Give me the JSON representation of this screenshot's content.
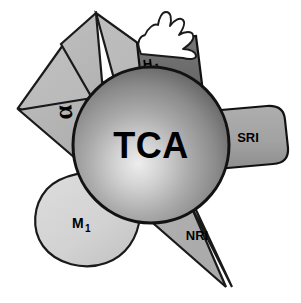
{
  "figure": {
    "title": "",
    "center": {
      "label": "TCA",
      "shape": "sphere",
      "fill_light": "#d9d9d9",
      "fill_mid": "#9a9a9a",
      "fill_dark": "#5f5f5f",
      "stroke": "#000000"
    },
    "receptors": [
      {
        "id": "alpha",
        "label": "α",
        "label_kind": "greek",
        "shape": "star-point-upper-left",
        "fill": "#b5b5b5",
        "stroke": "#000000",
        "label_x": 68,
        "label_y": 116,
        "label_size": 26,
        "label_rotation": -95
      },
      {
        "id": "h1",
        "label": "H",
        "subscript": "1",
        "label_kind": "subscripted",
        "shape": "tilted-bar-top",
        "fill": "#6e6e6e",
        "stroke": "#000000",
        "label_x": 152,
        "label_y": 64,
        "label_size": 13,
        "label_rotation": -8
      },
      {
        "id": "sri",
        "label": "SRI",
        "label_kind": "plain",
        "shape": "rounded-rect-right",
        "fill": "#9f9f9f",
        "stroke": "#000000",
        "label_x": 250,
        "label_y": 141,
        "label_size": 13,
        "label_rotation": 0
      },
      {
        "id": "nri",
        "label": "NRI",
        "label_kind": "plain",
        "shape": "star-point-lower-right",
        "fill": "#d6d6d6",
        "stroke": "#000000",
        "label_x": 197,
        "label_y": 240,
        "label_size": 13,
        "label_rotation": 0
      },
      {
        "id": "m1",
        "label": "M",
        "subscript": "1",
        "label_kind": "subscripted",
        "shape": "blob-lower-left",
        "fill": "#d2d2d2",
        "stroke": "#000000",
        "label_x": 82,
        "label_y": 228,
        "label_size": 14,
        "label_rotation": 0
      },
      {
        "id": "hand",
        "label": "",
        "label_kind": "none",
        "shape": "hand-top",
        "fill": "#ffffff",
        "stroke": "#000000",
        "label_x": 0,
        "label_y": 0,
        "label_size": 0,
        "label_rotation": 0
      }
    ],
    "star": {
      "fill": "#b8b8b8",
      "stroke": "#000000"
    },
    "background": "#ffffff"
  }
}
